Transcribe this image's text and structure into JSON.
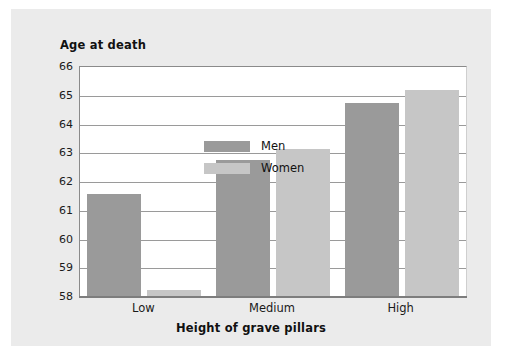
{
  "chart_data": {
    "type": "bar",
    "title": "Age at death",
    "xlabel": "Height of grave pillars",
    "ylabel": "Age at death",
    "categories": [
      "Low",
      "Medium",
      "High"
    ],
    "series": [
      {
        "name": "Men",
        "values": [
          61.6,
          62.75,
          64.75
        ],
        "color": "#9a9a9a"
      },
      {
        "name": "Women",
        "values": [
          58.25,
          63.15,
          65.2
        ],
        "color": "#c6c6c6"
      }
    ],
    "ylim": [
      58,
      66
    ],
    "yticks": [
      58,
      59,
      60,
      61,
      62,
      63,
      64,
      65,
      66
    ],
    "ytick_labels": [
      "58",
      "59",
      "60",
      "61",
      "62",
      "63",
      "64",
      "65",
      "66"
    ],
    "grid": true,
    "legend_position": "inside-top-left"
  },
  "colors": {
    "panel_background": "#ebebeb",
    "plot_background": "#ffffff",
    "gridline": "#9a9a9a",
    "axis": "#7d7d7d",
    "text": "#111111",
    "men": "#9a9a9a",
    "women": "#c6c6c6"
  }
}
